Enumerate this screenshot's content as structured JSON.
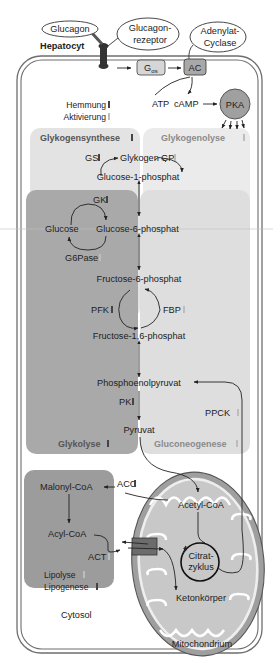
{
  "labels": {
    "glucagon": "Glucagon",
    "receptor_line1": "Glucagon-",
    "receptor_line2": "rezeptor",
    "adenylat_line1": "Adenylat-",
    "adenylat_line2": "Cyclase",
    "hepatocyt": "Hepatocyt",
    "gas_main": "G",
    "gas_sub": "αs",
    "ac": "AC",
    "atp": "ATP",
    "camp": "cAMP",
    "pka": "PKA",
    "cytosol": "Cytosol",
    "mitochondrium": "Mitochondrium"
  },
  "legend": {
    "inhibition": "Hemmung",
    "activation": "Aktivierung",
    "inhibition_color": "#555555",
    "activation_color": "#bdbdbd"
  },
  "regions": {
    "glykogensynthese": "Glykogensynthese",
    "glykogenolyse": "Glykogenolyse",
    "glykolyse": "Glykolyse",
    "gluconeogenese": "Gluconeogenese"
  },
  "metabolites": {
    "glykogen": "Glykogen",
    "g1p": "Glucose-1-phosphat",
    "glucose": "Glucose",
    "g6p": "Glucose-6-phosphat",
    "f6p": "Fructose-6-phosphat",
    "f16p": "Fructose-1,6-phosphat",
    "pep": "Phosphoenolpyruvat",
    "pyruvat": "Pyruvat",
    "malonyl": "Malonyl-CoA",
    "acyl": "Acyl-CoA",
    "acetyl": "Acetyl-CoA",
    "citrat_line1": "Citrat-",
    "citrat_line2": "zyklus",
    "keton": "Ketonkörper"
  },
  "enzymes": {
    "gs": "GS",
    "gp": "GP",
    "gk": "GK",
    "g6pase": "G6Pase",
    "pfk": "PFK",
    "fbp": "FBP",
    "pk": "PK",
    "ppck": "PPCK",
    "acc": "ACC",
    "act": "ACT"
  },
  "lipid": {
    "lipolyse": "Lipolyse",
    "lipogenese": "Lipogenese"
  },
  "colors": {
    "cell_border": "#6e6e6e",
    "dark_region": "#9c9c9c",
    "light_region": "#d9d9d9",
    "gluconeo_region": "#e2e2e2",
    "glycogen_region": "#ececec",
    "mito_fill": "#a8a8a8",
    "mito_inner": "#c7c7c7",
    "pka_fill": "#a0a0a0"
  }
}
